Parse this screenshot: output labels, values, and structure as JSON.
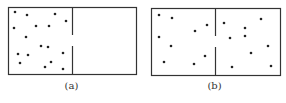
{
  "figure": {
    "panels": [
      {
        "id": "a",
        "caption": "(a)",
        "description": "All particles confined to left half of box",
        "box": {
          "x": 8,
          "y": 7,
          "w": 128,
          "h": 67
        },
        "divider": {
          "x": 72,
          "gap_top": 35,
          "gap_bottom": 46
        },
        "particles": [
          [
            15,
            12
          ],
          [
            27,
            15
          ],
          [
            55,
            14
          ],
          [
            66,
            21
          ],
          [
            14,
            28
          ],
          [
            36,
            26
          ],
          [
            49,
            26
          ],
          [
            26,
            37
          ],
          [
            41,
            46
          ],
          [
            48,
            47
          ],
          [
            18,
            54
          ],
          [
            28,
            55
          ],
          [
            63,
            53
          ],
          [
            20,
            63
          ],
          [
            51,
            62
          ],
          [
            45,
            67
          ],
          [
            63,
            69
          ]
        ]
      },
      {
        "id": "b",
        "caption": "(b)",
        "description": "Particles spread across both halves",
        "box": {
          "x": 8,
          "y": 8,
          "w": 129,
          "h": 67
        },
        "divider": {
          "x": 72,
          "gap_top": 36,
          "gap_bottom": 47
        },
        "particles": [
          [
            16,
            15
          ],
          [
            29,
            18
          ],
          [
            64,
            25
          ],
          [
            52,
            31
          ],
          [
            16,
            37
          ],
          [
            28,
            46
          ],
          [
            21,
            62
          ],
          [
            62,
            56
          ],
          [
            51,
            64
          ],
          [
            81,
            23
          ],
          [
            118,
            19
          ],
          [
            102,
            28
          ],
          [
            87,
            38
          ],
          [
            102,
            36
          ],
          [
            125,
            46
          ],
          [
            108,
            53
          ],
          [
            89,
            67
          ],
          [
            128,
            66
          ]
        ]
      }
    ],
    "colors": {
      "stroke": "#333333",
      "particle": "#222222"
    }
  }
}
